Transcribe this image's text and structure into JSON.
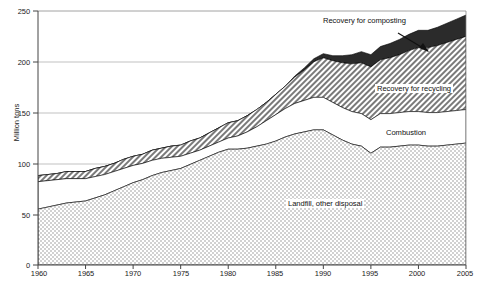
{
  "chart_data": {
    "type": "area",
    "title": "",
    "subtitle": "",
    "xlabel": "",
    "ylabel": "Million tons",
    "xlim": [
      1960,
      2005
    ],
    "ylim": [
      0,
      250
    ],
    "grid": true,
    "stacked": true,
    "legend_position": "inline-annotations",
    "x": [
      1960,
      1961,
      1962,
      1963,
      1964,
      1965,
      1966,
      1967,
      1968,
      1969,
      1970,
      1971,
      1972,
      1973,
      1974,
      1975,
      1976,
      1977,
      1978,
      1979,
      1980,
      1981,
      1982,
      1983,
      1984,
      1985,
      1986,
      1987,
      1988,
      1989,
      1990,
      1991,
      1992,
      1993,
      1994,
      1995,
      1996,
      1997,
      1998,
      1999,
      2000,
      2001,
      2002,
      2003,
      2004,
      2005
    ],
    "y_ticks": [
      0,
      50,
      100,
      150,
      200,
      250
    ],
    "x_ticks": [
      1960,
      1965,
      1970,
      1975,
      1980,
      1985,
      1990,
      1995,
      2000,
      2005
    ],
    "x_tick_labels": [
      "1960",
      "1965",
      "1970",
      "1975",
      "1980",
      "1985",
      "1990",
      "1995",
      "2000",
      "2005"
    ],
    "y_tick_labels": [
      "0",
      "50",
      "100",
      "150",
      "200",
      "250"
    ],
    "series": [
      {
        "name": "Landfill, other disposal",
        "fill": "dotted",
        "color": "#f2f2f2",
        "values": [
          55,
          57,
          59,
          61,
          62,
          63,
          66,
          69,
          73,
          77,
          81,
          84,
          88,
          91,
          93,
          95,
          99,
          103,
          107,
          111,
          114,
          114,
          115,
          117,
          119,
          122,
          126,
          129,
          131,
          133,
          133,
          128,
          123,
          119,
          117,
          110,
          116,
          116,
          117,
          118,
          118,
          117,
          117,
          118,
          119,
          120
        ]
      },
      {
        "name": "Combustion",
        "fill": "white",
        "color": "#ffffff",
        "values": [
          27,
          26,
          25,
          24,
          23,
          22,
          21,
          20,
          19,
          18,
          17,
          16,
          15,
          14,
          13,
          12,
          11,
          10,
          10,
          10,
          11,
          13,
          16,
          19,
          23,
          26,
          28,
          30,
          31,
          32,
          32,
          32,
          32,
          32,
          32,
          33,
          33,
          33,
          33,
          33,
          33,
          33,
          33,
          33,
          33,
          33
        ]
      },
      {
        "name": "Recovery for recycling",
        "fill": "hatched",
        "color": "#b6b6b6",
        "values": [
          6,
          6,
          6,
          7,
          7,
          7,
          8,
          8,
          8,
          9,
          9,
          9,
          10,
          10,
          11,
          11,
          12,
          12,
          13,
          14,
          15,
          15,
          16,
          17,
          18,
          20,
          22,
          26,
          30,
          35,
          39,
          41,
          44,
          47,
          50,
          52,
          53,
          55,
          57,
          60,
          63,
          64,
          66,
          68,
          70,
          72
        ]
      },
      {
        "name": "Recovery for composting",
        "fill": "solid-dark",
        "color": "#2b2b2b",
        "values": [
          0,
          0,
          0,
          0,
          0,
          0,
          0,
          0,
          0,
          0,
          0,
          0,
          0,
          0,
          0,
          0,
          0,
          0,
          0,
          0,
          0,
          0,
          0,
          0,
          0,
          0,
          0,
          1,
          2,
          3,
          4,
          5,
          7,
          9,
          11,
          12,
          13,
          14,
          15,
          16,
          17,
          17,
          18,
          19,
          20,
          21
        ]
      }
    ],
    "totals": [
      88,
      89,
      90,
      92,
      92,
      92,
      95,
      97,
      100,
      104,
      107,
      109,
      113,
      115,
      117,
      118,
      122,
      125,
      130,
      135,
      140,
      142,
      147,
      153,
      160,
      168,
      176,
      186,
      194,
      203,
      208,
      206,
      206,
      207,
      210,
      207,
      215,
      218,
      222,
      227,
      231,
      231,
      234,
      238,
      242,
      246
    ],
    "annotations": [
      {
        "text": "Recovery for  composting",
        "x": 0.78,
        "y": 0.95,
        "arrow": true
      },
      {
        "text": "Recovery for recycling",
        "x": 0.83,
        "y": 0.67,
        "arrow": false
      },
      {
        "text": "Combustion",
        "x": 0.87,
        "y": 0.5,
        "arrow": false
      },
      {
        "text": "Landfill, other disposal",
        "x": 0.65,
        "y": 0.22,
        "arrow": false
      }
    ]
  },
  "labels": {
    "y_axis_title": "Million tons",
    "composting": "Recovery for  composting",
    "recycling": "Recovery for recycling",
    "combustion": "Combustion",
    "landfill": "Landfill, other disposal"
  },
  "ticks": {
    "y": [
      "250",
      "200",
      "150",
      "100",
      "50",
      "0"
    ],
    "x": [
      "1960",
      "1965",
      "1970",
      "1975",
      "1980",
      "1985",
      "1990",
      "1995",
      "2000",
      "2005"
    ]
  }
}
